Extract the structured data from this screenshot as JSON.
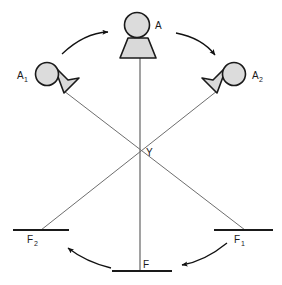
{
  "figure": {
    "background_color": "#ffffff",
    "stroke_color": "#1a1a1a",
    "line_color": "#6b6b6b",
    "shape_fill": "#d9d9d9",
    "width": 282,
    "height": 285
  },
  "labels": {
    "observer_a": {
      "text": "A",
      "sub": ""
    },
    "observer_a1": {
      "text": "A",
      "sub": "1"
    },
    "observer_a2": {
      "text": "A",
      "sub": "2"
    },
    "vertex_y": {
      "text": "Y",
      "sub": ""
    },
    "mirror_f": {
      "text": "F",
      "sub": ""
    },
    "mirror_f1": {
      "text": "F",
      "sub": "1"
    },
    "mirror_f2": {
      "text": "F",
      "sub": "2"
    }
  },
  "nodes": [
    {
      "name": "observer-a",
      "label": "A",
      "sub": "",
      "cx": 136,
      "cy": 24,
      "r": 12,
      "kind": "observer",
      "orientation": "down"
    },
    {
      "name": "observer-a1",
      "label": "A",
      "sub": "1",
      "cx": 48,
      "cy": 75,
      "r": 11,
      "kind": "observer",
      "orientation": "down-right"
    },
    {
      "name": "observer-a2",
      "label": "A",
      "sub": "2",
      "cx": 233,
      "cy": 75,
      "r": 11,
      "kind": "observer",
      "orientation": "down-left"
    },
    {
      "name": "vertex-y",
      "label": "Y",
      "sub": "",
      "cx": 140,
      "cy": 152,
      "r": 0,
      "kind": "vertex",
      "orientation": ""
    }
  ],
  "mirrors": [
    {
      "name": "mirror-f",
      "label": "F",
      "sub": "",
      "x1": 112,
      "x2": 172,
      "y": 271
    },
    {
      "name": "mirror-f1",
      "label": "F",
      "sub": "1",
      "x1": 214,
      "x2": 273,
      "y": 230
    },
    {
      "name": "mirror-f2",
      "label": "F",
      "sub": "2",
      "x1": 13,
      "x2": 69,
      "y": 230
    }
  ],
  "ray_lines": [
    {
      "name": "ray-a-to-f",
      "x1": 140,
      "y1": 58,
      "x2": 140,
      "y2": 271
    },
    {
      "name": "ray-a1-to-f1",
      "x1": 64,
      "y1": 91,
      "x2": 244,
      "y2": 230
    },
    {
      "name": "ray-a2-to-f2",
      "x1": 217,
      "y1": 91,
      "x2": 41,
      "y2": 230
    }
  ],
  "arrows": [
    {
      "name": "arrow-a1-to-a",
      "from_label": "A1",
      "to_label": "A",
      "direction": "right"
    },
    {
      "name": "arrow-a-to-a2",
      "from_label": "A",
      "to_label": "A2",
      "direction": "down-right"
    },
    {
      "name": "arrow-f-to-f2",
      "from_label": "F",
      "to_label": "F2",
      "direction": "up-left"
    },
    {
      "name": "arrow-f1-to-f",
      "from_label": "F1",
      "to_label": "F",
      "direction": "down-left"
    }
  ]
}
